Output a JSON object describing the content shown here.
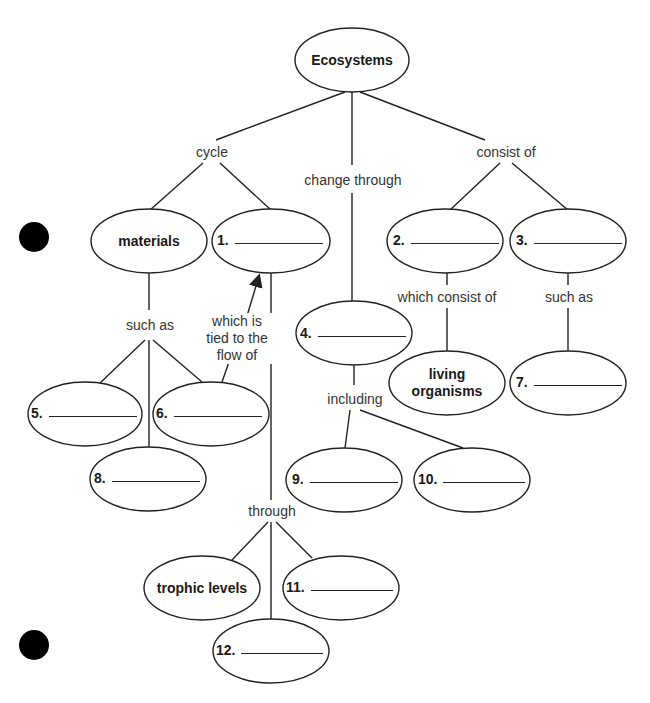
{
  "title": "Ecosystems",
  "nodes": {
    "root": "Ecosystems",
    "materials": "materials",
    "living_organisms_line1": "living",
    "living_organisms_line2": "organisms",
    "trophic_levels": "trophic levels"
  },
  "blanks": [
    {
      "num": "1."
    },
    {
      "num": "2."
    },
    {
      "num": "3."
    },
    {
      "num": "4."
    },
    {
      "num": "5."
    },
    {
      "num": "6."
    },
    {
      "num": "7."
    },
    {
      "num": "8."
    },
    {
      "num": "9."
    },
    {
      "num": "10."
    },
    {
      "num": "11."
    },
    {
      "num": "12."
    }
  ],
  "links": {
    "cycle": "cycle",
    "change_through": "change through",
    "consist_of": "consist of",
    "such_as_left": "such as",
    "tied_line1": "which is",
    "tied_line2": "tied to the",
    "tied_line3": "flow of",
    "which_consist_of": "which consist of",
    "such_as_right": "such as",
    "including": "including",
    "through": "through"
  }
}
